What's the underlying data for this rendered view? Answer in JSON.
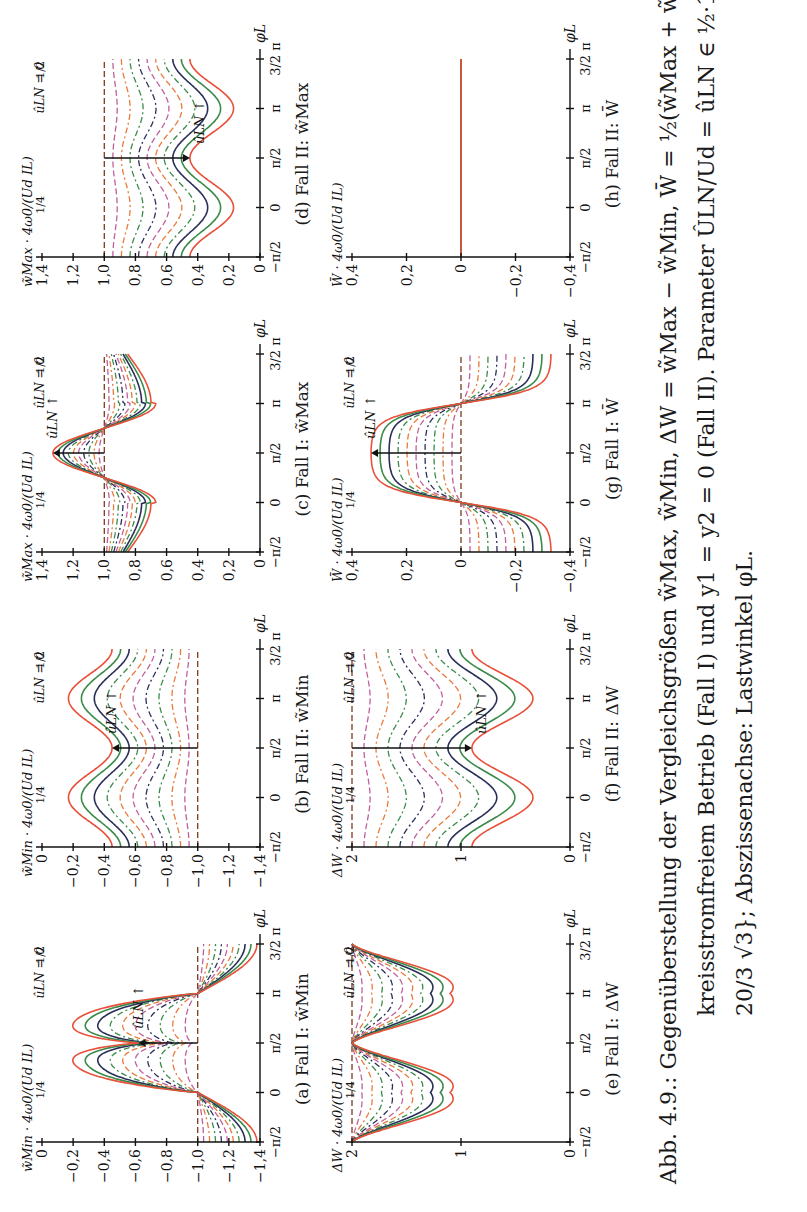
{
  "figure": {
    "orientation": "rotated 90° counter-clockwise",
    "x_axis": {
      "label": "φL",
      "ticks": [
        "−π/2",
        "0",
        "π/2",
        "π",
        "3/2 π"
      ],
      "range": [
        -1.5708,
        4.7124
      ]
    },
    "parameter_label": "ûLN",
    "parameter_arrow_label": "ûLN ↑",
    "annotations": {
      "zero": "ûLN = 0",
      "quarter": "1/4",
      "half": "1/2"
    },
    "series_colors": [
      "#7a3b1c",
      "#c0609a",
      "#e87a3a",
      "#3a8a4a",
      "#2a2f5a",
      "#c0609a",
      "#e87a3a",
      "#3a8a4a",
      "#2a2f5a",
      "#3a8a4a",
      "#e8503a"
    ]
  },
  "panels": [
    {
      "id": "a",
      "caption": "(a) Fall I: w̃Min",
      "ylabel": "w̃Min · 4ω0/(Ud IL)",
      "yticks": [
        "0",
        "−0,2",
        "−0,4",
        "−0,6",
        "−0,8",
        "−1,0",
        "−1,2",
        "−1,4"
      ],
      "ylim": [
        -1.4,
        0
      ],
      "kind": "fall1_min"
    },
    {
      "id": "b",
      "caption": "(b) Fall II: w̃Min",
      "ylabel": "w̃Min · 4ω0/(Ud IL)",
      "yticks": [
        "0",
        "−0,2",
        "−0,4",
        "−0,6",
        "−0,8",
        "−1,0",
        "−1,2",
        "−1,4"
      ],
      "ylim": [
        -1.4,
        0
      ],
      "kind": "fall2_min"
    },
    {
      "id": "c",
      "caption": "(c) Fall I: w̃Max",
      "ylabel": "w̃Max · 4ω0/(Ud IL)",
      "yticks": [
        "1,4",
        "1,2",
        "1,0",
        "0,8",
        "0,6",
        "0,4",
        "0,2",
        "0"
      ],
      "ylim": [
        0,
        1.4
      ],
      "kind": "fall1_max"
    },
    {
      "id": "d",
      "caption": "(d) Fall II: w̃Max",
      "ylabel": "w̃Max · 4ω0/(Ud IL)",
      "yticks": [
        "1,4",
        "1,2",
        "1,0",
        "0,8",
        "0,6",
        "0,4",
        "0,2",
        "0"
      ],
      "ylim": [
        0,
        1.4
      ],
      "kind": "fall2_max"
    },
    {
      "id": "e",
      "caption": "(e) Fall I: ΔW",
      "ylabel": "ΔW · 4ω0/(Ud IL)",
      "yticks": [
        "2",
        "1",
        "0"
      ],
      "ylim": [
        0,
        2
      ],
      "kind": "fall1_dw"
    },
    {
      "id": "f",
      "caption": "(f) Fall II: ΔW",
      "ylabel": "ΔW · 4ω0/(Ud IL)",
      "yticks": [
        "2",
        "1",
        "0"
      ],
      "ylim": [
        0,
        2
      ],
      "kind": "fall2_dw"
    },
    {
      "id": "g",
      "caption": "(g) Fall I: W̄",
      "ylabel": "W̄ · 4ω0/(Ud IL)",
      "yticks": [
        "0,4",
        "0,2",
        "0",
        "−0,2",
        "−0,4"
      ],
      "ylim": [
        -0.4,
        0.4
      ],
      "kind": "fall1_mean"
    },
    {
      "id": "h",
      "caption": "(h) Fall II: W̄",
      "ylabel": "W̄ · 4ω0/(Ud IL)",
      "yticks": [
        "0,4",
        "0,2",
        "0",
        "−0,2",
        "−0,4"
      ],
      "ylim": [
        -0.4,
        0.4
      ],
      "kind": "fall2_mean"
    }
  ],
  "caption": {
    "line1": "Abb. 4.9.: Gegenüberstellung der Vergleichsgrößen w̃Max, w̃Min, ΔW = w̃Max − w̃Min, W̄ = ½(w̃Max + w̃Min) bei",
    "line2": "kreisstromfreiem Betrieb (Fall I) und y1 = y2 = 0 (Fall II). Parameter ÛLN/Ud = ûLN ∈ ½·1/10{0, 1, . . . , 11,",
    "line3": "20/3 √3}; Abszissenachse: Lastwinkel φL."
  },
  "chart_data": [
    {
      "type": "line",
      "title": "(a) Fall I: w̃Min",
      "xlabel": "φL",
      "ylabel": "w̃Min 4ω0/(Ud IL)",
      "x_ticks": [
        "−π/2",
        "0",
        "π/2",
        "π",
        "3/2 π"
      ],
      "ylim": [
        -1.4,
        0
      ],
      "series_param": "ûLN from 0 to ≈0.577",
      "description": "ûLN=0: flat at −1.0; larger ûLN gives double-hump curves rising up to ≈ −0.3 between 0 and π, dip at π/2 ≈ −0.6, and falling to ≈ −1.35 at −π/2 and 3/2π",
      "series": [
        {
          "name": "ûLN = 0",
          "values": [
            -1.0,
            -1.0,
            -1.0,
            -1.0,
            -1.0
          ]
        },
        {
          "name": "ûLN = 1/4",
          "values": [
            -1.15,
            -1.0,
            -0.85,
            -1.0,
            -1.15
          ]
        },
        {
          "name": "ûLN = 1/2",
          "values": [
            -1.3,
            -1.0,
            -0.6,
            -1.0,
            -1.3
          ]
        }
      ]
    },
    {
      "type": "line",
      "title": "(b) Fall II: w̃Min",
      "xlabel": "φL",
      "ylabel": "w̃Min 4ω0/(Ud IL)",
      "x_ticks": [
        "−π/2",
        "0",
        "π/2",
        "π",
        "3/2 π"
      ],
      "ylim": [
        -1.4,
        0
      ],
      "description": "ûLN=0 flat at −1.0; curves shift upward with ûLN, peaks at 0 and π, troughs at π/2",
      "series": [
        {
          "name": "ûLN = 0",
          "values": [
            -1.0,
            -1.0,
            -1.0,
            -1.0,
            -1.0
          ]
        },
        {
          "name": "ûLN = 1/4",
          "values": [
            -0.85,
            -0.78,
            -0.88,
            -0.78,
            -0.85
          ]
        },
        {
          "name": "ûLN = 1/2",
          "values": [
            -0.6,
            -0.38,
            -0.6,
            -0.38,
            -0.6
          ]
        },
        {
          "name": "ûLN max",
          "values": [
            -0.45,
            -0.17,
            -0.5,
            -0.17,
            -0.45
          ]
        }
      ]
    },
    {
      "type": "line",
      "title": "(c) Fall I: w̃Max",
      "xlabel": "φL",
      "ylabel": "w̃Max 4ω0/(Ud IL)",
      "x_ticks": [
        "−π/2",
        "0",
        "π/2",
        "π",
        "3/2 π"
      ],
      "ylim": [
        0,
        1.4
      ],
      "description": "ûLN=0 flat at 1.0; curves dip to ≈0.55 near 0 and π, peak ≈1.33 at π/2, cross 1.0 near π/4 and 3π/4",
      "series": [
        {
          "name": "ûLN = 0",
          "values": [
            1.0,
            1.0,
            1.0,
            1.0,
            1.0
          ]
        },
        {
          "name": "ûLN = 1/4",
          "values": [
            0.85,
            0.85,
            1.15,
            0.85,
            0.85
          ]
        },
        {
          "name": "ûLN = 1/2",
          "values": [
            0.72,
            0.65,
            1.3,
            0.65,
            0.72
          ]
        }
      ]
    },
    {
      "type": "line",
      "title": "(d) Fall II: w̃Max",
      "xlabel": "φL",
      "ylabel": "w̃Max 4ω0/(Ud IL)",
      "x_ticks": [
        "−π/2",
        "0",
        "π/2",
        "π",
        "3/2 π"
      ],
      "ylim": [
        0,
        1.4
      ],
      "description": "ûLN=0 flat at 1.0; curves shift downward with ûLN, troughs at 0 and π (down to ≈0.17), peaks at π/2",
      "series": [
        {
          "name": "ûLN = 0",
          "values": [
            1.0,
            1.0,
            1.0,
            1.0,
            1.0
          ]
        },
        {
          "name": "ûLN = 1/4",
          "values": [
            0.85,
            0.78,
            0.88,
            0.78,
            0.85
          ]
        },
        {
          "name": "ûLN = 1/2",
          "values": [
            0.6,
            0.38,
            0.6,
            0.38,
            0.6
          ]
        },
        {
          "name": "ûLN max",
          "values": [
            0.45,
            0.17,
            0.5,
            0.17,
            0.45
          ]
        }
      ]
    },
    {
      "type": "line",
      "title": "(e) Fall I: ΔW",
      "xlabel": "φL",
      "ylabel": "ΔW 4ω0/(Ud IL)",
      "x_ticks": [
        "−π/2",
        "0",
        "π/2",
        "π",
        "3/2 π"
      ],
      "ylim": [
        0,
        2
      ],
      "description": "ûLN=0 flat at 2; curves dip to ≈1.1 near 0 and π, return to 2 at −π/2, π/2, 3/2π",
      "series": [
        {
          "name": "ûLN = 0",
          "values": [
            2,
            2,
            2,
            2,
            2
          ]
        },
        {
          "name": "ûLN = 1/4",
          "values": [
            2,
            1.7,
            2,
            1.7,
            2
          ]
        },
        {
          "name": "ûLN = 1/2",
          "values": [
            2,
            1.25,
            2,
            1.25,
            2
          ]
        },
        {
          "name": "ûLN max",
          "values": [
            2,
            1.1,
            2,
            1.1,
            2
          ]
        }
      ]
    },
    {
      "type": "line",
      "title": "(f) Fall II: ΔW",
      "xlabel": "φL",
      "ylabel": "ΔW 4ω0/(Ud IL)",
      "x_ticks": [
        "−π/2",
        "0",
        "π/2",
        "π",
        "3/2 π"
      ],
      "ylim": [
        0,
        2
      ],
      "description": "ûLN=0 flat at 2; curves shift downward with ûLN, troughs at 0 and π (≈0.35 for max), local max at π/2",
      "series": [
        {
          "name": "ûLN = 0",
          "values": [
            2,
            2,
            2,
            2,
            2
          ]
        },
        {
          "name": "ûLN = 1/4",
          "values": [
            1.7,
            1.55,
            1.75,
            1.55,
            1.7
          ]
        },
        {
          "name": "ûLN = 1/2",
          "values": [
            1.2,
            0.75,
            1.2,
            0.75,
            1.2
          ]
        },
        {
          "name": "ûLN max",
          "values": [
            0.9,
            0.35,
            0.95,
            0.35,
            0.9
          ]
        }
      ]
    },
    {
      "type": "line",
      "title": "(g) Fall I: W̄",
      "xlabel": "φL",
      "ylabel": "W̄ 4ω0/(Ud IL)",
      "x_ticks": [
        "−π/2",
        "0",
        "π/2",
        "π",
        "3/2 π"
      ],
      "ylim": [
        -0.4,
        0.4
      ],
      "description": "ûLN=0 flat at 0; curves sinusoid-like: ≈−0.3 at −π/2 and 3/2π, zero crossings at 0 and π, peak ≈0.33 at π/2",
      "series": [
        {
          "name": "ûLN = 0",
          "values": [
            0,
            0,
            0,
            0,
            0
          ]
        },
        {
          "name": "ûLN = 1/4",
          "values": [
            -0.15,
            0,
            0.15,
            0,
            -0.15
          ]
        },
        {
          "name": "ûLN = 1/2",
          "values": [
            -0.28,
            0,
            0.3,
            0,
            -0.28
          ]
        },
        {
          "name": "ûLN max",
          "values": [
            -0.3,
            0,
            0.33,
            0,
            -0.3
          ]
        }
      ]
    },
    {
      "type": "line",
      "title": "(h) Fall II: W̄",
      "xlabel": "φL",
      "ylabel": "W̄ 4ω0/(Ud IL)",
      "x_ticks": [
        "−π/2",
        "0",
        "π/2",
        "π",
        "3/2 π"
      ],
      "ylim": [
        -0.4,
        0.4
      ],
      "description": "All curves coincide at W̄ = 0",
      "series": [
        {
          "name": "all ûLN",
          "values": [
            0,
            0,
            0,
            0,
            0
          ]
        }
      ]
    }
  ]
}
